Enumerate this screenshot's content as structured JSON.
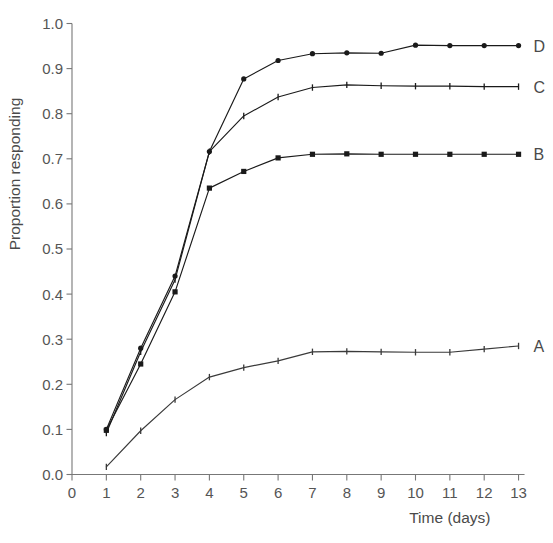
{
  "chart_data": {
    "type": "line",
    "title": "",
    "subtitle": "",
    "xlabel": "Time (days)",
    "ylabel": "Proportion responding",
    "xlim": [
      0,
      13
    ],
    "ylim": [
      0.0,
      1.0
    ],
    "grid": false,
    "legend_position": "right-of-line-ends",
    "x_ticks": [
      "0",
      "1",
      "2",
      "3",
      "4",
      "5",
      "6",
      "7",
      "8",
      "9",
      "10",
      "11",
      "12",
      "13"
    ],
    "x_tick_values": [
      0,
      1,
      2,
      3,
      4,
      5,
      6,
      7,
      8,
      9,
      10,
      11,
      12,
      13
    ],
    "y_ticks": [
      "0.0",
      "0.1",
      "0.2",
      "0.3",
      "0.4",
      "0.5",
      "0.6",
      "0.7",
      "0.8",
      "0.9",
      "1.0"
    ],
    "y_tick_values": [
      0.0,
      0.1,
      0.2,
      0.3,
      0.4,
      0.5,
      0.6,
      0.7,
      0.8,
      0.9,
      1.0
    ],
    "x": [
      1,
      2,
      3,
      4,
      5,
      6,
      7,
      8,
      9,
      10,
      11,
      12,
      13
    ],
    "series": [
      {
        "name": "D",
        "label": "D",
        "marker": "circle",
        "color": "#1a1a1a",
        "values": [
          0.1,
          0.28,
          0.44,
          0.716,
          0.877,
          0.918,
          0.933,
          0.935,
          0.934,
          0.952,
          0.951,
          0.951,
          0.951
        ]
      },
      {
        "name": "C",
        "label": "C",
        "marker": "tick",
        "color": "#1a1a1a",
        "values": [
          0.092,
          0.272,
          0.432,
          0.716,
          0.795,
          0.837,
          0.858,
          0.864,
          0.862,
          0.861,
          0.861,
          0.86,
          0.86
        ]
      },
      {
        "name": "B",
        "label": "B",
        "marker": "square",
        "color": "#1a1a1a",
        "values": [
          0.098,
          0.245,
          0.405,
          0.635,
          0.672,
          0.702,
          0.71,
          0.711,
          0.71,
          0.71,
          0.71,
          0.71,
          0.71
        ]
      },
      {
        "name": "A",
        "label": "A",
        "marker": "tick",
        "color": "#3a3a3a",
        "values": [
          0.017,
          0.097,
          0.166,
          0.216,
          0.237,
          0.252,
          0.272,
          0.273,
          0.272,
          0.271,
          0.271,
          0.278,
          0.285
        ]
      }
    ]
  }
}
